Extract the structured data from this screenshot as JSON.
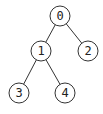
{
  "tree": {
    "nodes": [
      {
        "id": "0",
        "label": "0",
        "x": 60,
        "y": 16
      },
      {
        "id": "1",
        "label": "1",
        "x": 41,
        "y": 51
      },
      {
        "id": "2",
        "label": "2",
        "x": 88,
        "y": 51
      },
      {
        "id": "3",
        "label": "3",
        "x": 19,
        "y": 93
      },
      {
        "id": "4",
        "label": "4",
        "x": 65,
        "y": 93
      }
    ],
    "edges": [
      {
        "from": "0",
        "to": "1"
      },
      {
        "from": "0",
        "to": "2"
      },
      {
        "from": "1",
        "to": "3"
      },
      {
        "from": "1",
        "to": "4"
      }
    ]
  }
}
